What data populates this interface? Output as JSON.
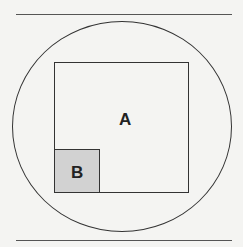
{
  "diagram": {
    "type": "set-inclusion",
    "universe": {
      "shape": "circle"
    },
    "sets": [
      {
        "label": "A",
        "shape": "square",
        "fill": "#f4f4f2"
      },
      {
        "label": "B",
        "shape": "square",
        "fill": "#d2d2d2",
        "subset_of": "A"
      }
    ]
  }
}
